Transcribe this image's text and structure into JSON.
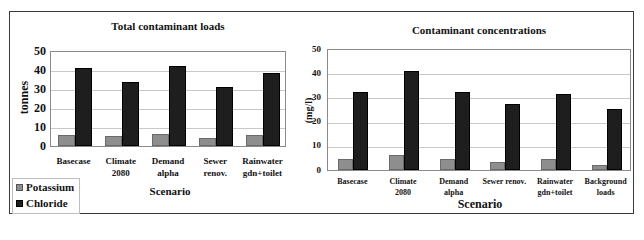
{
  "chart_data": [
    {
      "type": "bar",
      "title": "Total contaminant loads",
      "xlabel": "Scenario",
      "ylabel": "tonnes",
      "ylim": [
        0,
        50
      ],
      "yticks": [
        "0",
        "10",
        "20",
        "30",
        "40",
        "50"
      ],
      "grid": true,
      "categories": [
        "Basecase",
        "Climate\n2080",
        "Demand\nalpha",
        "Sewer\nrenov.",
        "Rainwater\ngdn+toilet"
      ],
      "series": [
        {
          "name": "Potassium",
          "color": "#8e8e8e",
          "values": [
            5.7,
            5.2,
            6.2,
            4.3,
            5.7
          ]
        },
        {
          "name": "Chloride",
          "color": "#1e1e1e",
          "values": [
            41.3,
            33.8,
            42.2,
            30.9,
            38.5
          ]
        }
      ],
      "legend_position": "bottom-left"
    },
    {
      "type": "bar",
      "title": "Contaminant concentrations",
      "xlabel": "Scenario",
      "ylabel": "(mg/l)",
      "ylim": [
        0,
        50
      ],
      "yticks": [
        "0",
        "10",
        "20",
        "30",
        "40",
        "50"
      ],
      "grid": true,
      "categories": [
        "Basecase",
        "Climate\n2080",
        "Demand\nalpha",
        "Sewer renov.",
        "Rainwater\ngdn+toilet",
        "Background\nloads"
      ],
      "series": [
        {
          "name": "Potassium",
          "color": "#8e8e8e",
          "values": [
            4.5,
            6.1,
            4.5,
            3.3,
            4.5,
            2.2
          ]
        },
        {
          "name": "Chloride",
          "color": "#1e1e1e",
          "values": [
            32.2,
            41.0,
            32.3,
            27.4,
            31.5,
            25.3
          ]
        }
      ]
    }
  ],
  "legend": {
    "items": [
      {
        "label": "Potassium",
        "color": "#8e8e8e"
      },
      {
        "label": "Chloride",
        "color": "#1e1e1e"
      }
    ]
  }
}
